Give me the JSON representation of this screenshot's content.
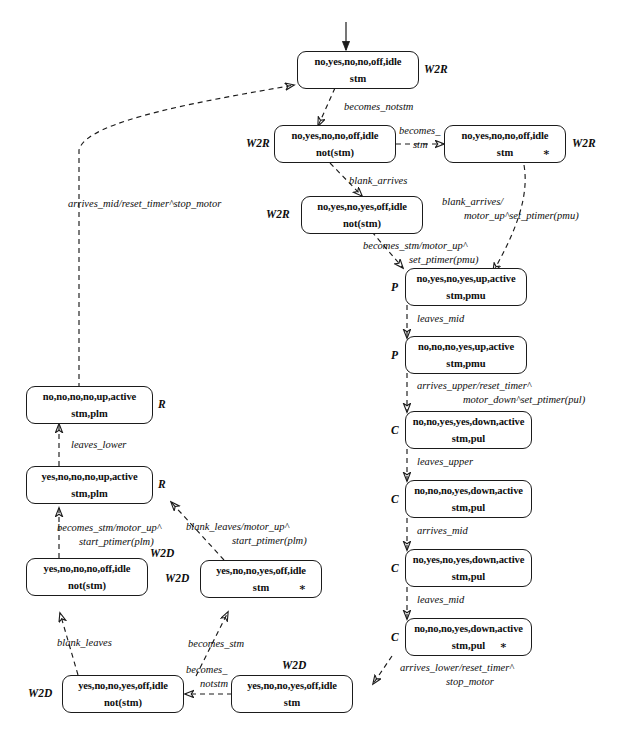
{
  "diagram": {
    "stroke_color": "#1b1b1b",
    "background_color": "#ffffff"
  },
  "states": [
    {
      "id": "s1",
      "line1": "no,yes,no,no,off,idle",
      "line2": "stm",
      "tag": "W2R",
      "star": false
    },
    {
      "id": "s2",
      "line1": "no,yes,no,no,off,idle",
      "line2": "not(stm)",
      "tag": "W2R",
      "star": false
    },
    {
      "id": "s3",
      "line1": "no,yes,no,no,off,idle",
      "line2": "stm",
      "tag": "W2R",
      "star": true
    },
    {
      "id": "s4",
      "line1": "no,yes,no,yes,off,idle",
      "line2": "not(stm)",
      "tag": "W2R",
      "star": false
    },
    {
      "id": "s5",
      "line1": "no,yes,no,yes,up,active",
      "line2": "stm,pmu",
      "tag": "P",
      "star": false
    },
    {
      "id": "s6",
      "line1": "no,no,no,yes,up,active",
      "line2": "stm,pmu",
      "tag": "P",
      "star": false
    },
    {
      "id": "s7",
      "line1": "no,no,yes,yes,down,active",
      "line2": "stm,pul",
      "tag": "C",
      "star": false
    },
    {
      "id": "s8",
      "line1": "no,no,no,yes,down,active",
      "line2": "stm,pul",
      "tag": "C",
      "star": false
    },
    {
      "id": "s9",
      "line1": "no,yes,no,yes,down,active",
      "line2": "stm,pul",
      "tag": "C",
      "star": false
    },
    {
      "id": "s10",
      "line1": "no,no,no,yes,down,active",
      "line2": "stm,pul",
      "tag": "C",
      "star": true
    },
    {
      "id": "s11",
      "line1": "yes,no,no,yes,off,idle",
      "line2": "stm",
      "tag": "W2D",
      "star": false
    },
    {
      "id": "s12",
      "line1": "yes,no,no,yes,off,idle",
      "line2": "not(stm)",
      "tag": "W2D",
      "star": false
    },
    {
      "id": "s13",
      "line1": "yes,no,no,yes,off,idle",
      "line2": "stm",
      "tag": "W2D",
      "star": true
    },
    {
      "id": "s14",
      "line1": "yes,no,no,no,off,idle",
      "line2": "not(stm)",
      "tag": "W2D",
      "star": false
    },
    {
      "id": "s15",
      "line1": "yes,no,no,no,up,active",
      "line2": "stm,plm",
      "tag": "R",
      "star": false
    },
    {
      "id": "s16",
      "line1": "no,no,no,no,up,active",
      "line2": "stm,plm",
      "tag": "R",
      "star": false
    }
  ],
  "transitions": [
    {
      "id": "t1",
      "line1": "becomes_notstm",
      "line2": ""
    },
    {
      "id": "t2",
      "line1": "becomes_",
      "line2": "stm"
    },
    {
      "id": "t3",
      "line1": "blank_arrives",
      "line2": ""
    },
    {
      "id": "t4",
      "line1": "blank_arrives/",
      "line2": "motor_up^set_ptimer(pmu)"
    },
    {
      "id": "t5",
      "line1": "becomes_stm/motor_up^",
      "line2": "set_ptimer(pmu)"
    },
    {
      "id": "t6",
      "line1": "leaves_mid",
      "line2": ""
    },
    {
      "id": "t7",
      "line1": "arrives_upper/reset_timer^",
      "line2": "motor_down^set_ptimer(pul)"
    },
    {
      "id": "t8",
      "line1": "leaves_upper",
      "line2": ""
    },
    {
      "id": "t9",
      "line1": "arrives_mid",
      "line2": ""
    },
    {
      "id": "t10",
      "line1": "leaves_mid",
      "line2": ""
    },
    {
      "id": "t11",
      "line1": "arrives_lower/reset_timer^",
      "line2": "stop_motor"
    },
    {
      "id": "t12",
      "line1": "becomes_",
      "line2": "notstm"
    },
    {
      "id": "t13",
      "line1": "becomes_stm",
      "line2": ""
    },
    {
      "id": "t14",
      "line1": "blank_leaves",
      "line2": ""
    },
    {
      "id": "t15",
      "line1": "becomes_stm/motor_up^",
      "line2": "start_ptimer(plm)"
    },
    {
      "id": "t16",
      "line1": "blank_leaves/motor_up^",
      "line2": "start_ptimer(plm)"
    },
    {
      "id": "t17",
      "line1": "leaves_lower",
      "line2": ""
    },
    {
      "id": "t18",
      "line1": "arrives_mid/reset_timer^stop_motor",
      "line2": ""
    }
  ]
}
